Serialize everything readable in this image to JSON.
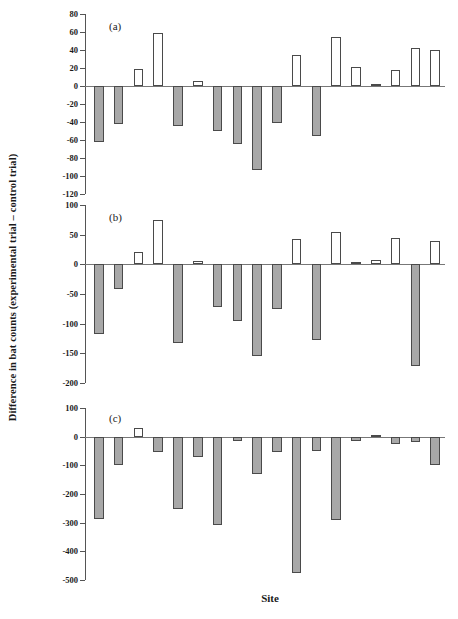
{
  "figure": {
    "ylabel": "Difference in bat counts (experimental trial – control trial)",
    "xlabel": "Site",
    "colors": {
      "filled_bar": "#a8a8a8",
      "open_bar": "#ffffff",
      "bar_outline": "#4a4a4a",
      "axis": "#555555",
      "baseline": "#777777"
    }
  },
  "panels": [
    {
      "id": "a",
      "letter": "(a)"
    },
    {
      "id": "b",
      "letter": "(b)"
    },
    {
      "id": "c",
      "letter": "(c)"
    }
  ],
  "chart_data": [
    {
      "type": "bar",
      "panel": "a",
      "title": "(a)",
      "xlabel": "Site",
      "ylabel": "Difference in bat counts (experimental trial - control trial)",
      "ylim": [
        -120,
        80
      ],
      "yticks": [
        80,
        60,
        40,
        20,
        0,
        -20,
        -40,
        -60,
        -80,
        -100,
        -120
      ],
      "ytick_labels": [
        "80",
        "60",
        "40",
        "20",
        "0",
        "-20",
        "-40",
        "-60",
        "-80",
        "-100",
        "-120"
      ],
      "grid": false,
      "legend": "none",
      "categories": [
        "1",
        "2",
        "3",
        "4",
        "5",
        "6",
        "7",
        "8",
        "9",
        "10",
        "11",
        "12",
        "13",
        "14",
        "15",
        "16",
        "17",
        "18"
      ],
      "values": [
        -62,
        -42,
        19,
        59,
        -44,
        6,
        -50,
        -64,
        -93,
        -41,
        35,
        -56,
        54,
        21,
        2,
        18,
        42,
        40
      ],
      "bar_fill": [
        "filled",
        "filled",
        "open",
        "open",
        "filled",
        "open",
        "filled",
        "filled",
        "filled",
        "filled",
        "open",
        "filled",
        "open",
        "open",
        "open",
        "open",
        "open",
        "open"
      ]
    },
    {
      "type": "bar",
      "panel": "b",
      "title": "(b)",
      "xlabel": "Site",
      "ylabel": "Difference in bat counts (experimental trial - control trial)",
      "ylim": [
        -200,
        100
      ],
      "yticks": [
        100,
        50,
        0,
        -50,
        -100,
        -150,
        -200
      ],
      "ytick_labels": [
        "100",
        "50",
        "0",
        "-50",
        "-100",
        "-150",
        "-200"
      ],
      "grid": false,
      "legend": "none",
      "categories": [
        "1",
        "2",
        "3",
        "4",
        "5",
        "6",
        "7",
        "8",
        "9",
        "10",
        "11",
        "12",
        "13",
        "14",
        "15",
        "16",
        "17",
        "18"
      ],
      "values": [
        -118,
        -42,
        20,
        75,
        -132,
        5,
        -72,
        -95,
        -155,
        -75,
        42,
        -128,
        55,
        4,
        8,
        45,
        -172,
        40
      ],
      "bar_fill": [
        "filled",
        "filled",
        "open",
        "open",
        "filled",
        "open",
        "filled",
        "filled",
        "filled",
        "filled",
        "open",
        "filled",
        "open",
        "open",
        "open",
        "open",
        "filled",
        "open"
      ]
    },
    {
      "type": "bar",
      "panel": "c",
      "title": "(c)",
      "xlabel": "Site",
      "ylabel": "Difference in bat counts (experimental trial - control trial)",
      "ylim": [
        -500,
        100
      ],
      "yticks": [
        100,
        0,
        -100,
        -200,
        -300,
        -400,
        -500
      ],
      "ytick_labels": [
        "100",
        "0",
        "-100",
        "-200",
        "-300",
        "-400",
        "-500"
      ],
      "grid": false,
      "legend": "none",
      "categories": [
        "1",
        "2",
        "3",
        "4",
        "5",
        "6",
        "7",
        "8",
        "9",
        "10",
        "11",
        "12",
        "13",
        "14",
        "15",
        "16",
        "17",
        "18"
      ],
      "values": [
        -287,
        -100,
        30,
        -55,
        -252,
        -70,
        -307,
        -15,
        -130,
        -55,
        -475,
        -50,
        -292,
        -15,
        5,
        -25,
        -20,
        -100
      ],
      "bar_fill": [
        "filled",
        "filled",
        "open",
        "filled",
        "filled",
        "filled",
        "filled",
        "filled",
        "filled",
        "filled",
        "filled",
        "filled",
        "filled",
        "filled",
        "open",
        "filled",
        "filled",
        "filled"
      ]
    }
  ]
}
